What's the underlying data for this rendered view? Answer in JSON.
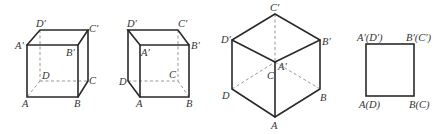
{
  "figures": [
    {
      "id": "cube-front-right",
      "labels": {
        "A": "A",
        "B": "B",
        "C": "C",
        "D": "D",
        "A1": "A′",
        "B1": "B′",
        "C1": "C′",
        "D1": "D′"
      }
    },
    {
      "id": "cube-front-left",
      "labels": {
        "A": "A",
        "B": "B",
        "C": "C",
        "D": "D",
        "A1": "A′",
        "B1": "B′",
        "C1": "C′",
        "D1": "D′"
      }
    },
    {
      "id": "cube-isometric",
      "labels": {
        "A": "A",
        "B": "B",
        "C": "C",
        "D": "D",
        "A1": "A′",
        "B1": "B′",
        "C1": "C′",
        "D1": "D′"
      }
    },
    {
      "id": "square-front-view",
      "labels": {
        "top_left": "A′(D′)",
        "top_right": "B′(C′)",
        "bottom_left": "A(D)",
        "bottom_right": "B(C)"
      }
    }
  ],
  "colors": {
    "edge": "#2a2a2a",
    "hidden_edge": "#8a8a8a",
    "label": "#333333"
  }
}
